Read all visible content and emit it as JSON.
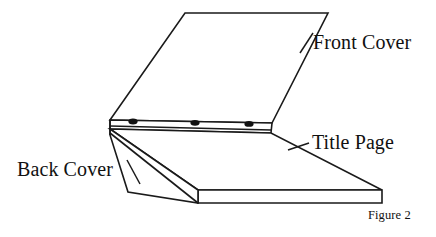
{
  "figure": {
    "caption": "Figure 2",
    "background_color": "#ffffff",
    "line_color": "#1a1a1a",
    "hole_color": "#111111"
  },
  "labels": {
    "front_cover": "Front Cover",
    "title_page": "Title Page",
    "back_cover": "Back Cover"
  },
  "parts": {
    "front_cover_name": "front-cover-panel",
    "title_page_name": "title-page-panel",
    "back_cover_name": "back-cover-panel",
    "spine_name": "spine-strip",
    "stack_name": "page-stack-edge"
  },
  "rings": {
    "count": 3,
    "hole_labels": [
      "ring-hole-1",
      "ring-hole-2",
      "ring-hole-3"
    ]
  },
  "leaders": {
    "front_cover_leader": "leader-line-front-cover",
    "title_page_leader": "leader-line-title-page",
    "back_cover_leader": "leader-line-back-cover"
  }
}
